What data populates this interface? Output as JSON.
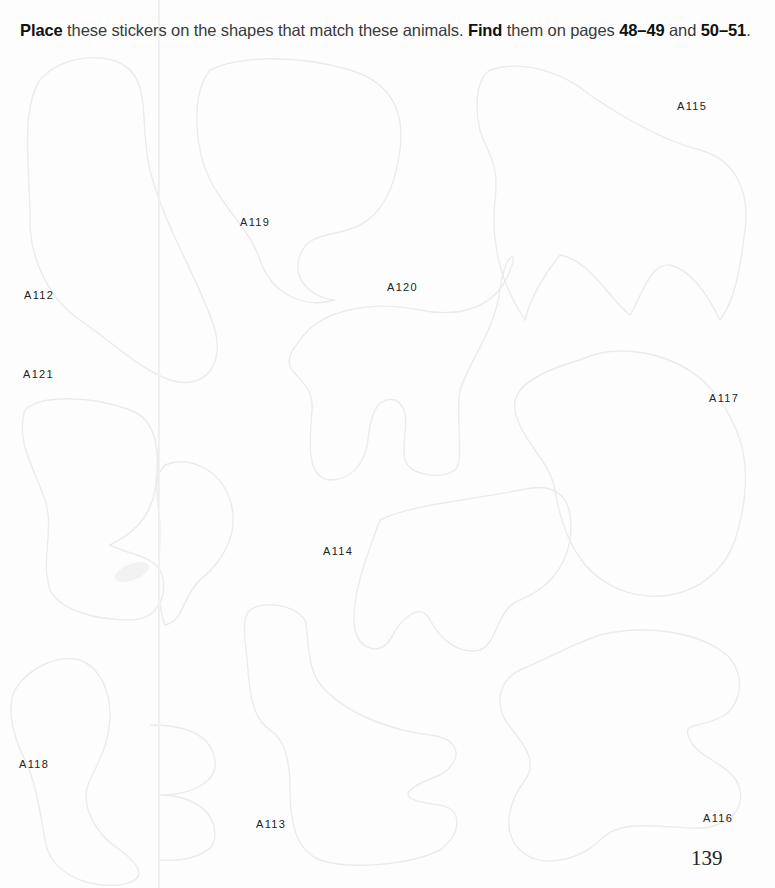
{
  "instruction": {
    "part1_bold": "Place",
    "part2": " these stickers on the shapes that match these animals. ",
    "part3_bold": "Find",
    "part4": " them on pages ",
    "part5_bold": "48–49",
    "part6": " and ",
    "part7_bold": "50–51",
    "part8": "."
  },
  "stickers": [
    {
      "id": "A115",
      "label": "A115",
      "x": 677,
      "y": 100
    },
    {
      "id": "A119",
      "label": "A119",
      "x": 240,
      "y": 216
    },
    {
      "id": "A120",
      "label": "A120",
      "x": 387,
      "y": 281
    },
    {
      "id": "A112",
      "label": "A112",
      "x": 24,
      "y": 289
    },
    {
      "id": "A121",
      "label": "A121",
      "x": 23,
      "y": 368
    },
    {
      "id": "A117",
      "label": "A117",
      "x": 709,
      "y": 392
    },
    {
      "id": "A114",
      "label": "A114",
      "x": 323,
      "y": 545
    },
    {
      "id": "A118",
      "label": "A118",
      "x": 19,
      "y": 758
    },
    {
      "id": "A113",
      "label": "A113",
      "x": 256,
      "y": 818
    },
    {
      "id": "A116",
      "label": "A116",
      "x": 703,
      "y": 812
    }
  ],
  "page_number": "139",
  "colors": {
    "outline": "#ececec",
    "text": "#222222",
    "background": "#fdfdfd"
  }
}
